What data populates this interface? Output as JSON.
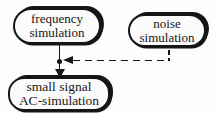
{
  "diagram": {
    "background": "#fdfdfd",
    "ink": "#161616",
    "nodes": {
      "frequency": {
        "line1": "frequency",
        "line2": "simulation"
      },
      "noise": {
        "line1": "noise",
        "line2": "simulation"
      },
      "ac": {
        "line1": "small signal",
        "line2": "AC-simulation"
      }
    },
    "edges": [
      {
        "id": "frequency-to-ac",
        "style": "solid",
        "arrow": "down",
        "from": "frequency simulation",
        "to": "small signal AC-simulation"
      },
      {
        "id": "noise-to-junction",
        "style": "dashed",
        "arrow": "left",
        "from": "noise simulation",
        "to": "junction on frequency-to-ac edge"
      }
    ]
  }
}
